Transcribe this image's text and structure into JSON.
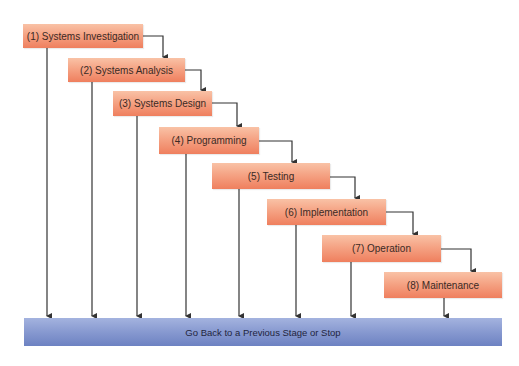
{
  "diagram": {
    "type": "waterfall-flowchart",
    "colors": {
      "stage_fill_top": "#f9c2a6",
      "stage_fill_bottom": "#ef7f5e",
      "bar_fill_top": "#a4b3df",
      "bar_fill_bottom": "#6d82c2",
      "line": "#333333"
    },
    "stages": [
      {
        "label": "(1) Systems Investigation"
      },
      {
        "label": "(2) Systems Analysis"
      },
      {
        "label": "(3) Systems Design"
      },
      {
        "label": "(4) Programming"
      },
      {
        "label": "(5) Testing"
      },
      {
        "label": "(6) Implementation"
      },
      {
        "label": "(7) Operation"
      },
      {
        "label": "(8) Maintenance"
      }
    ],
    "bottom_bar": {
      "label": "Go Back to a Previous Stage or Stop"
    }
  }
}
